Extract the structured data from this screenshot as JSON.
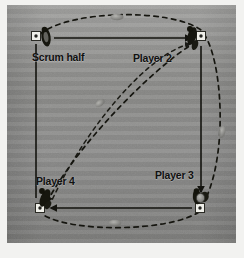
{
  "figure": {
    "kind": "rugby-passing-drill-diagram",
    "background_color": "#8e8e8c",
    "page_color": "#f2f2f0",
    "line_color": "#14140f",
    "cone_color": "#f0f0ea",
    "ball_color": "#8a8a86"
  },
  "labels": {
    "scrum_half": "Scrum half",
    "player_2": "Player 2",
    "player_3": "Player 3",
    "player_4": "Player 4"
  },
  "positions": {
    "scrum_half": {
      "x": 36,
      "y": 36
    },
    "player_2": {
      "x": 201,
      "y": 36
    },
    "player_3": {
      "x": 200,
      "y": 208
    },
    "player_4": {
      "x": 40,
      "y": 208
    }
  },
  "icons": {
    "cone": "cone-marker-icon",
    "player": "player-figure-icon",
    "ball": "rugby-ball-icon"
  },
  "paths": {
    "pass_top": "Scrum half to Player 2",
    "run_right": "Player 2 to Player 3",
    "pass_bottom": "Player 3 to Player 4",
    "run_left": "Player 4 to Scrum half",
    "ball_diagonal": "Player 2 to Player 4 diagonal ball path",
    "ball_loop": "dashed ball circuit around the grid"
  }
}
